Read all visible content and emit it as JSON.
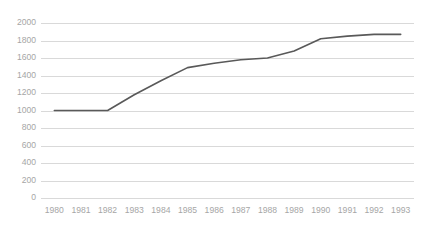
{
  "chart_data": {
    "type": "line",
    "title": "",
    "subtitle": "",
    "xlabel": "",
    "ylabel": "",
    "categories": [
      "1980",
      "1981",
      "1982",
      "1983",
      "1984",
      "1985",
      "1986",
      "1987",
      "1988",
      "1989",
      "1990",
      "1991",
      "1992",
      "1993"
    ],
    "x": [
      1980,
      1981,
      1982,
      1983,
      1984,
      1985,
      1986,
      1987,
      1988,
      1989,
      1990,
      1991,
      1992,
      1993
    ],
    "values": [
      1000,
      1000,
      1000,
      1180,
      1340,
      1490,
      1540,
      1580,
      1600,
      1680,
      1820,
      1850,
      1870,
      1870
    ],
    "series": [
      {
        "name": "series-1",
        "color": "#595959",
        "values": [
          1000,
          1000,
          1000,
          1180,
          1340,
          1490,
          1540,
          1580,
          1600,
          1680,
          1820,
          1850,
          1870,
          1870
        ]
      }
    ],
    "ylim": [
      0,
      2000
    ],
    "yticks": [
      0,
      200,
      400,
      600,
      800,
      1000,
      1200,
      1400,
      1600,
      1800,
      2000
    ],
    "ytick_labels": [
      "0",
      "200",
      "400",
      "600",
      "800",
      "1000",
      "1200",
      "1400",
      "1600",
      "1800",
      "2000"
    ],
    "xtick_labels": [
      "1980",
      "1981",
      "1982",
      "1983",
      "1984",
      "1985",
      "1986",
      "1987",
      "1988",
      "1989",
      "1990",
      "1991",
      "1992",
      "1993"
    ],
    "grid": true,
    "grid_axis": "y",
    "legend": false,
    "legend_position": "none",
    "annotations": []
  },
  "style": {
    "background": "#ffffff",
    "gridline_color": "#d9d9d9",
    "axis_text_color": "#a6a6a6",
    "line_color": "#595959"
  }
}
